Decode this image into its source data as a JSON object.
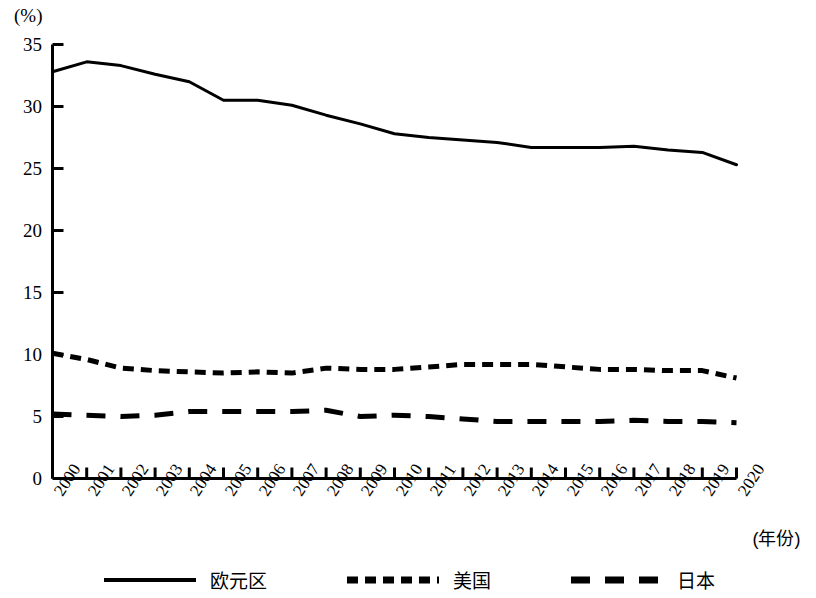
{
  "chart_data": {
    "type": "line",
    "title": "",
    "subtitle": "",
    "ylabel": "(%)",
    "xlabel": "(年份)",
    "ylim": [
      0,
      35
    ],
    "yticks": [
      0,
      5,
      10,
      15,
      20,
      25,
      30,
      35
    ],
    "ytick_labels": [
      "0",
      "5",
      "10",
      "15",
      "20",
      "25",
      "30",
      "35"
    ],
    "grid": false,
    "legend_position": "bottom",
    "categories": [
      "2000",
      "2001",
      "2002",
      "2003",
      "2004",
      "2005",
      "2006",
      "2007",
      "2008",
      "2009",
      "2010",
      "2011",
      "2012",
      "2013",
      "2014",
      "2015",
      "2016",
      "2017",
      "2018",
      "2019",
      "2020"
    ],
    "series": [
      {
        "name": "欧元区",
        "style": "solid",
        "values": [
          32.8,
          33.6,
          33.3,
          32.6,
          32.0,
          30.5,
          30.5,
          30.1,
          29.3,
          28.6,
          27.8,
          27.5,
          27.3,
          27.1,
          26.7,
          26.7,
          26.7,
          26.8,
          26.5,
          26.3,
          25.3
        ]
      },
      {
        "name": "美国",
        "style": "dashed-fine",
        "values": [
          10.1,
          9.6,
          8.9,
          8.7,
          8.6,
          8.5,
          8.6,
          8.5,
          8.9,
          8.8,
          8.8,
          9.0,
          9.2,
          9.2,
          9.2,
          9.0,
          8.8,
          8.8,
          8.7,
          8.7,
          8.1
        ]
      },
      {
        "name": "日本",
        "style": "dashed-coarse",
        "values": [
          5.2,
          5.1,
          5.0,
          5.1,
          5.4,
          5.4,
          5.4,
          5.4,
          5.5,
          5.0,
          5.1,
          5.0,
          4.8,
          4.6,
          4.6,
          4.6,
          4.6,
          4.7,
          4.6,
          4.6,
          4.5
        ]
      }
    ]
  },
  "axis": {
    "unit_label": "(%)",
    "x_title": "(年份)"
  },
  "legend": {
    "items": [
      {
        "label": "欧元区",
        "swatch": "solid-line-swatch"
      },
      {
        "label": "美国",
        "swatch": "fine-dashed-line-swatch"
      },
      {
        "label": "日本",
        "swatch": "coarse-dashed-line-swatch"
      }
    ]
  }
}
